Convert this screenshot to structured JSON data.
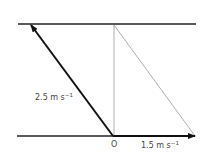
{
  "diagram": {
    "type": "vector-diagram",
    "labels": {
      "resultant_velocity": "2.5 m s",
      "resultant_unit_exp": "−1",
      "river_velocity": "1.5 m s",
      "river_unit_exp": "−1",
      "origin": "O"
    },
    "elements": {
      "top_bank": {
        "x1": 18,
        "y1": 24,
        "x2": 196,
        "y2": 24
      },
      "bottom_bank": {
        "x1": 17,
        "y1": 136,
        "x2": 195,
        "y2": 136
      },
      "resultant_arrow": {
        "x1": 113,
        "y1": 136,
        "x2": 31,
        "y2": 25
      },
      "river_arrow": {
        "x1": 113,
        "y1": 136,
        "x2": 195,
        "y2": 136
      },
      "vertical_line": {
        "x1": 114,
        "y1": 25,
        "x2": 114,
        "y2": 136
      },
      "diagonal_line": {
        "x1": 114,
        "y1": 25,
        "x2": 195,
        "y2": 136
      }
    },
    "colors": {
      "line": "#111111",
      "thin_line": "#888888",
      "text": "#444444"
    }
  }
}
